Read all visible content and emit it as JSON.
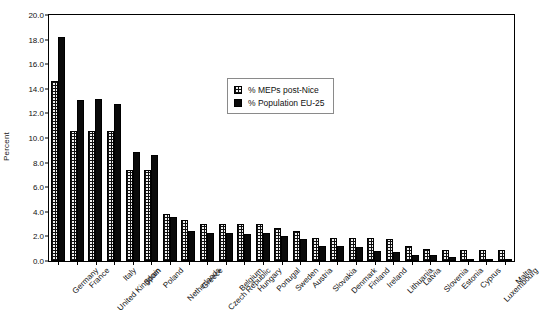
{
  "chart_data": {
    "type": "bar",
    "title": "",
    "xlabel": "",
    "ylabel": "Percent",
    "ylim": [
      0.0,
      20.0
    ],
    "ytick_step": 2.0,
    "ytick_labels": [
      "0.0",
      "2.0",
      "4.0",
      "6.0",
      "8.0",
      "10.0",
      "12.0",
      "14.0",
      "16.0",
      "18.0",
      "20.0"
    ],
    "grid": false,
    "legend_position": "upper-center",
    "categories": [
      "Germany",
      "France",
      "United Kingdom",
      "Italy",
      "Spain",
      "Poland",
      "Netherlands",
      "Greece",
      "Czech Republic",
      "Belgium",
      "Hungary",
      "Portugal",
      "Sweden",
      "Austria",
      "Slovakia",
      "Denmark",
      "Finland",
      "Ireland",
      "Lithuania",
      "Latvia",
      "Slovenia",
      "Estonia",
      "Cyprus",
      "Luxembourg",
      "Malta"
    ],
    "series": [
      {
        "name": "% MEPs post-Nice",
        "pattern": "checkered",
        "color": "#f2f2f2",
        "values": [
          14.6,
          10.6,
          10.6,
          10.6,
          7.4,
          7.4,
          3.8,
          3.3,
          3.05,
          3.0,
          3.0,
          3.0,
          2.7,
          2.45,
          1.9,
          1.9,
          1.9,
          1.9,
          1.8,
          1.25,
          1.0,
          0.9,
          0.9,
          0.9,
          0.9
        ]
      },
      {
        "name": "% Population EU-25",
        "pattern": "solid",
        "color": "#0a0a0a",
        "values": [
          18.2,
          13.1,
          13.2,
          12.8,
          8.9,
          8.6,
          3.6,
          2.45,
          2.3,
          2.25,
          2.2,
          2.3,
          2.0,
          1.8,
          1.2,
          1.2,
          1.15,
          0.85,
          0.75,
          0.5,
          0.45,
          0.3,
          0.2,
          0.1,
          0.1
        ]
      }
    ]
  },
  "legend": {
    "entries": [
      {
        "label": "% MEPs post-Nice"
      },
      {
        "label": "% Population EU-25"
      }
    ]
  }
}
